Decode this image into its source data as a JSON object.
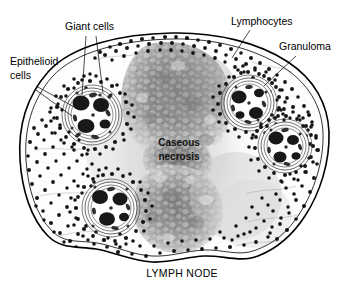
{
  "figure": {
    "title_caption": "LYMPH NODE",
    "background_color": "#ffffff",
    "ink_color": "#000000"
  },
  "labels": {
    "giant_cells": "Giant cells",
    "epithelioid_cells_line1": "Epithelioid",
    "epithelioid_cells_line2": "cells",
    "lymphocytes": "Lymphocytes",
    "granuloma": "Granuloma",
    "caseous_line1": "Caseous",
    "caseous_line2": "necrosis",
    "lymph_node": "LYMPH NODE"
  },
  "colors": {
    "node_fill": "#fdfdfd",
    "capsule_stroke": "#000000",
    "necrosis_dark": "#777777",
    "necrosis_mid": "#9a9a9a",
    "necrosis_light": "#c2c2c2",
    "lymphocyte_dot": "#151515",
    "giant_cell_nucleus": "#1a1a1a",
    "epithelioid_outline": "#2a2a2a"
  },
  "structures": {
    "granulomas": [
      {
        "name": "granuloma-upper-left",
        "cx": 90,
        "cy": 115,
        "r": 28
      },
      {
        "name": "granuloma-upper-right",
        "cx": 248,
        "cy": 104,
        "r": 26
      },
      {
        "name": "granuloma-right",
        "cx": 285,
        "cy": 145,
        "r": 25
      },
      {
        "name": "granuloma-lower-left",
        "cx": 112,
        "cy": 208,
        "r": 27
      }
    ],
    "caseous_necrosis": {
      "name": "caseous-necrosis-zone",
      "cx": 172,
      "cy": 145
    },
    "lymphocyte_count": 620
  }
}
